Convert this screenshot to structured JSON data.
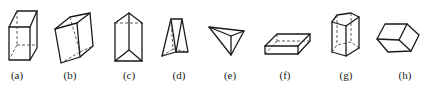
{
  "figure": {
    "shapes": [
      {
        "id": "a",
        "label": "(a)",
        "name": "rectangular prism (upright cuboid)"
      },
      {
        "id": "b",
        "label": "(b)",
        "name": "oblique quadrilateral prism"
      },
      {
        "id": "c",
        "label": "(c)",
        "name": "triangular prism"
      },
      {
        "id": "d",
        "label": "(d)",
        "name": "triangular prism (wedge)"
      },
      {
        "id": "e",
        "label": "(e)",
        "name": "triangular pyramid / tetrahedron"
      },
      {
        "id": "f",
        "label": "(f)",
        "name": "flat rectangular prism (slab)"
      },
      {
        "id": "g",
        "label": "(g)",
        "name": "pentagonal prism"
      },
      {
        "id": "h",
        "label": "(h)",
        "name": "hexagonal-outline parallelepiped"
      }
    ]
  }
}
